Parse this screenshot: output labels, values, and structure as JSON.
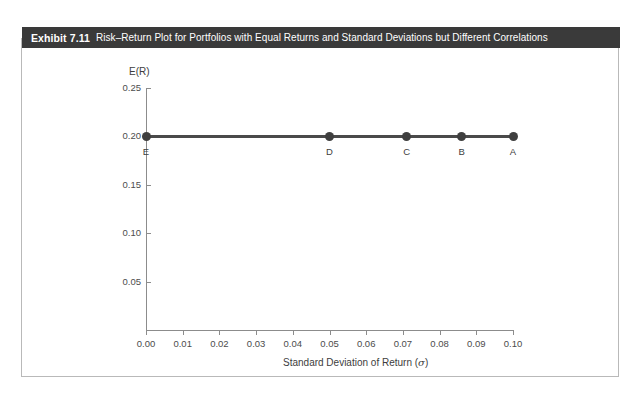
{
  "exhibit": {
    "number": "Exhibit 7.11",
    "caption": "Risk–Return Plot for Portfolios with Equal Returns and Standard Deviations but Different Correlations",
    "header_bg": "#3a3a3a",
    "header_text_color": "#ffffff",
    "frame_border_color": "#b9b9b9"
  },
  "chart_data": {
    "type": "scatter",
    "title": "Risk–Return Plot for Portfolios with Equal Returns and Standard Deviations but Different Correlations",
    "xlabel": "Standard Deviation of Return (σ)",
    "xlabel_text": "Standard Deviation of Return (",
    "xlabel_symbol": "σ",
    "xlabel_close": ")",
    "ylabel": "E(R)",
    "xlim": [
      0.0,
      0.1
    ],
    "ylim": [
      0.0,
      0.25
    ],
    "xticks": [
      "0.00",
      "0.01",
      "0.02",
      "0.03",
      "0.04",
      "0.05",
      "0.06",
      "0.07",
      "0.08",
      "0.09",
      "0.10"
    ],
    "xtick_values": [
      0.0,
      0.01,
      0.02,
      0.03,
      0.04,
      0.05,
      0.06,
      0.07,
      0.08,
      0.09,
      0.1
    ],
    "yticks": [
      "0.25",
      "0.20",
      "0.15",
      "0.10",
      "0.05"
    ],
    "ytick_values": [
      0.25,
      0.2,
      0.15,
      0.1,
      0.05
    ],
    "grid": false,
    "legend": "none",
    "series": [
      {
        "name": "Portfolios with equal returns",
        "color": "#3f3f3f",
        "line_color": "#4a4a4a",
        "points": [
          {
            "label": "E",
            "x": 0.0,
            "y": 0.2
          },
          {
            "label": "D",
            "x": 0.05,
            "y": 0.2
          },
          {
            "label": "C",
            "x": 0.071,
            "y": 0.2
          },
          {
            "label": "B",
            "x": 0.086,
            "y": 0.2
          },
          {
            "label": "A",
            "x": 0.1,
            "y": 0.2
          }
        ]
      }
    ],
    "point_labels": [
      "E",
      "D",
      "C",
      "B",
      "A"
    ],
    "x_values": [
      0.0,
      0.05,
      0.071,
      0.086,
      0.1
    ],
    "y_values": [
      0.2,
      0.2,
      0.2,
      0.2,
      0.2
    ]
  }
}
